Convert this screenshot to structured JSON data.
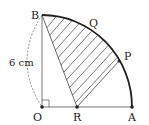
{
  "figure": {
    "type": "geometry-diagram",
    "points": {
      "O": {
        "label": "O",
        "x": 42,
        "y": 107
      },
      "A": {
        "label": "A",
        "x": 132,
        "y": 107
      },
      "B": {
        "label": "B",
        "x": 42,
        "y": 15
      },
      "R": {
        "label": "R",
        "x": 77,
        "y": 107
      },
      "P": {
        "label": "P",
        "x": 119,
        "y": 61
      },
      "Q": {
        "label": "Q",
        "x": 90,
        "y": 28
      }
    },
    "labels": {
      "O": "O",
      "A": "A",
      "B": "B",
      "R": "R",
      "P": "P",
      "Q": "Q",
      "length": "6 cm"
    },
    "annotations": {
      "right_angle_at": "O",
      "dashed_arc": "OB length marker",
      "shaded_region": "B-R-P-arc",
      "hatch": "diagonal lines"
    },
    "colors": {
      "stroke": "#333333",
      "arc": "#222222",
      "hatch": "#444444",
      "background": "#ffffff"
    }
  }
}
